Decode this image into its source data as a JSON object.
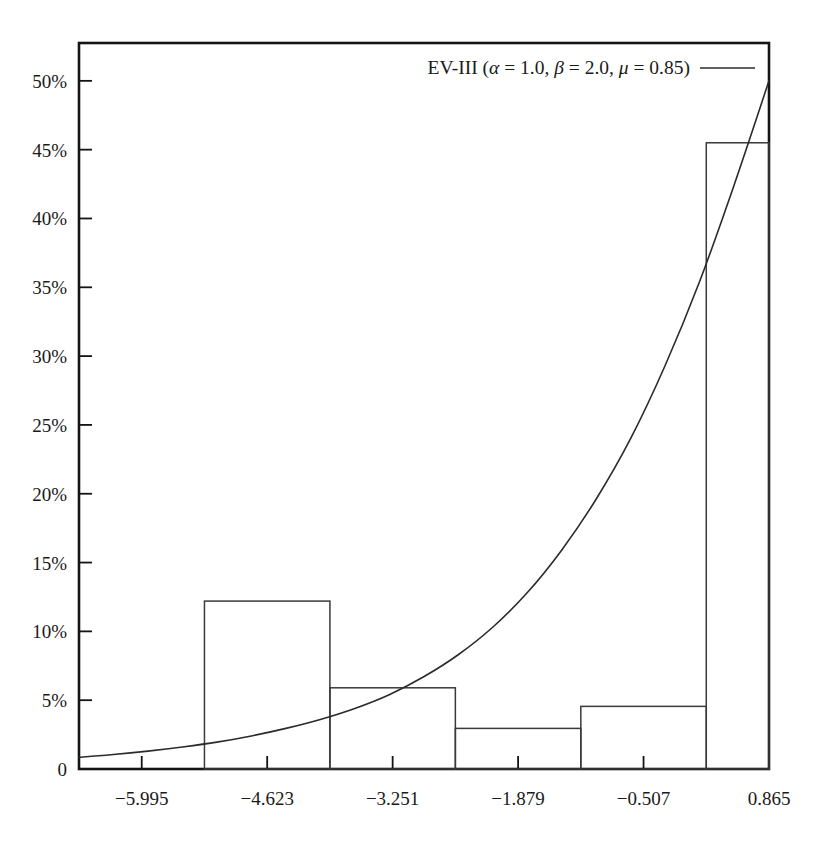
{
  "chart_data": {
    "type": "bar",
    "title": "",
    "subtitle": "",
    "xlabel": "",
    "ylabel": "",
    "grid": false,
    "legend_position": "top-right",
    "xlim": [
      -6.681,
      0.865
    ],
    "ylim": [
      0,
      0.5275
    ],
    "xtick_labels": [
      "−5.995",
      "−4.623",
      "−3.251",
      "−1.879",
      "−0.507",
      "0.865"
    ],
    "xtick_values": [
      -5.995,
      -4.623,
      -3.251,
      -1.879,
      -0.507,
      0.865
    ],
    "ytick_labels": [
      "0",
      "5%",
      "10%",
      "15%",
      "20%",
      "25%",
      "30%",
      "35%",
      "40%",
      "45%",
      "50%"
    ],
    "ytick_values": [
      0,
      5,
      10,
      15,
      20,
      25,
      30,
      35,
      40,
      45,
      50
    ],
    "bin_edges": [
      -6.681,
      -5.309,
      -3.937,
      -2.565,
      -1.193,
      0.179,
      0.865
    ],
    "histogram": {
      "bin_starts": [
        -6.681,
        -5.309,
        -3.937,
        -2.565,
        -1.193,
        0.179
      ],
      "bin_ends": [
        -5.309,
        -3.937,
        -2.565,
        -1.193,
        0.179,
        0.865
      ],
      "values_percent": [
        0,
        12.2,
        5.9,
        2.95,
        4.55,
        45.5
      ]
    },
    "series": [
      {
        "name": "EV-III",
        "style": "line",
        "legend_label": "EV-III (α = 1.0, β = 2.0, μ = 0.85)",
        "parameters": {
          "alpha": 1.0,
          "beta": 2.0,
          "mu": 0.85
        },
        "x": [
          -6.681,
          -6.304,
          -5.927,
          -5.55,
          -5.173,
          -4.796,
          -4.419,
          -4.042,
          -3.665,
          -3.288,
          -2.911,
          -2.534,
          -2.157,
          -1.78,
          -1.403,
          -1.026,
          -0.649,
          -0.272,
          0.105,
          0.482,
          0.865
        ],
        "values_percent": [
          0.85,
          1.05,
          1.3,
          1.6,
          1.95,
          2.4,
          2.95,
          3.6,
          4.4,
          5.4,
          6.7,
          8.3,
          10.3,
          12.8,
          15.9,
          19.6,
          24.0,
          29.3,
          35.4,
          42.4,
          50.0
        ]
      }
    ]
  },
  "legend": {
    "entries": [
      {
        "label_prefix": "EV-III (",
        "alpha_sym": "α",
        "alpha_eq": " = 1.0, ",
        "beta_sym": "β",
        "beta_eq": " = 2.0, ",
        "mu_sym": "μ",
        "mu_eq": " = 0.85)",
        "full_label": "EV-III (α = 1.0, β = 2.0, μ = 0.85)"
      }
    ]
  },
  "axes": {
    "y_labels": [
      "50%",
      "45%",
      "40%",
      "35%",
      "30%",
      "25%",
      "20%",
      "15%",
      "10%",
      "5%",
      "0"
    ],
    "x_labels": [
      "−5.995",
      "−4.623",
      "−3.251",
      "−1.879",
      "−0.507",
      "0.865"
    ]
  },
  "colors": {
    "frame": "#141414",
    "bar_stroke": "#3a3a3a",
    "curve": "#2b2b2b",
    "background": "#ffffff",
    "text": "#1a1a1a"
  }
}
